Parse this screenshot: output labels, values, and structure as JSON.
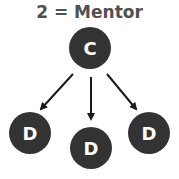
{
  "title": "2 = Mentor",
  "colors": {
    "node_fill": "#333333",
    "node_text": "#ffffff",
    "arrow": "#1a1a1a",
    "title": "#505050",
    "background": "#ffffff"
  },
  "nodes": [
    {
      "id": "mentor",
      "label": "C",
      "cx": 90,
      "cy": 48,
      "r": 21
    },
    {
      "id": "left",
      "label": "D",
      "cx": 30,
      "cy": 133,
      "r": 21
    },
    {
      "id": "middle",
      "label": "D",
      "cx": 91,
      "cy": 148,
      "r": 21
    },
    {
      "id": "right",
      "label": "D",
      "cx": 149,
      "cy": 133,
      "r": 21
    }
  ],
  "edges": [
    {
      "from": "mentor",
      "to": "left"
    },
    {
      "from": "mentor",
      "to": "middle"
    },
    {
      "from": "mentor",
      "to": "right"
    }
  ]
}
